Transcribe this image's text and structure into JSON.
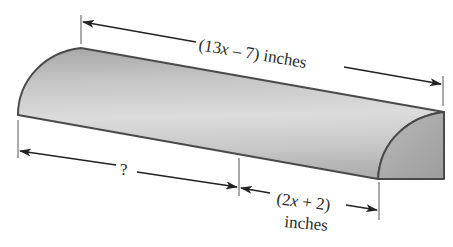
{
  "figure": {
    "type": "quarter-round molding piece (3D solid)",
    "colors": {
      "outline": "#4a4a4a",
      "surface_light": "#d9d9d9",
      "surface_mid": "#b8b8b8",
      "surface_dark": "#9a9a9a",
      "end_face": "#a9a9a9",
      "dimension_line": "#222222",
      "background": "#ffffff"
    },
    "dimensions": {
      "total_length": {
        "open_paren": "(13",
        "var": "x",
        "rest": " – 7) inches",
        "full_text": "(13x – 7) inches"
      },
      "unknown_part": {
        "label": "?"
      },
      "known_part": {
        "open_paren": "(2",
        "var": "x",
        "rest": " + 2)",
        "unit": "inches",
        "full_text": "(2x + 2) inches"
      }
    }
  }
}
